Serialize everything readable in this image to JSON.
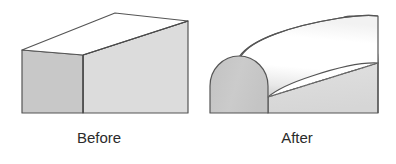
{
  "figure": {
    "background_color": "#ffffff",
    "panels": [
      {
        "id": "before",
        "label": "Before",
        "shape": "rectangular-box-sharp-edge",
        "description": "Isometric rectangular block with sharp top edges, cropped at bottom of frame"
      },
      {
        "id": "after",
        "label": "After",
        "shape": "rectangular-box-filleted-edge",
        "description": "Same block with the long top edge rounded over into a half-round fillet"
      }
    ]
  },
  "colors": {
    "top_face": "#ffffff",
    "left_face": "#c8c8c8",
    "right_face": "#dcdcdc",
    "end_cap": "#c8c8c8",
    "outline": "#555555",
    "highlight": "#ffffff",
    "dotted_edge": "#6b6b6b",
    "caption_text": "#2b2b2b"
  },
  "geometry": {
    "before": {
      "top_face_points": "22,50 115,13 188,21 83,55",
      "left_face_points": "22,50 83,55 83,113 22,113",
      "right_face_points": "83,55 188,21 188,113 83,113",
      "front_vertical_edge_x": 83,
      "left_edge_x": 22,
      "right_edge_x": 188,
      "bottom_cutoff_y": 113
    },
    "after": {
      "cap_left_x": 210,
      "cap_right_x": 268,
      "cap_arc_top_y": 57,
      "cap_bottom_y": 113,
      "far_end_right_x": 378,
      "far_arc_top_y": 16,
      "far_arc_shoulder_y": 63,
      "tangent_dotted_from": "268,97",
      "tangent_dotted_to": "378,63"
    }
  },
  "captions": {
    "before": "Before",
    "after": "After"
  }
}
